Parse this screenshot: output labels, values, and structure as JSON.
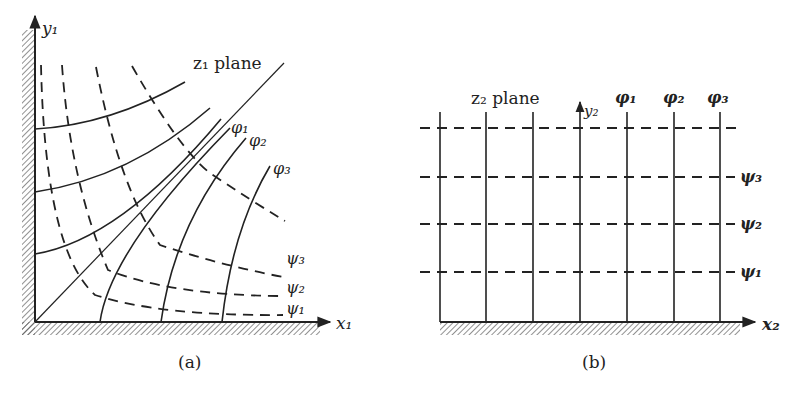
{
  "figure": {
    "panel_a": {
      "caption": "(a)",
      "plane_label": "z₁ plane",
      "x_axis_label": "x₁",
      "y_axis_label": "y₁",
      "phi_labels": [
        "φ₁",
        "φ₂",
        "φ₃"
      ],
      "psi_labels": [
        "ψ₃",
        "ψ₂",
        "ψ₁"
      ]
    },
    "panel_b": {
      "caption": "(b)",
      "plane_label": "z₂ plane",
      "x_axis_label": "x₂",
      "y_axis_label": "y₂",
      "phi_labels": [
        "φ₁",
        "φ₂",
        "φ₃"
      ],
      "psi_labels": [
        "ψ₃",
        "ψ₂",
        "ψ₁"
      ]
    },
    "colors": {
      "ink": "#222222",
      "background": "#ffffff",
      "hatch": "#555555"
    }
  }
}
